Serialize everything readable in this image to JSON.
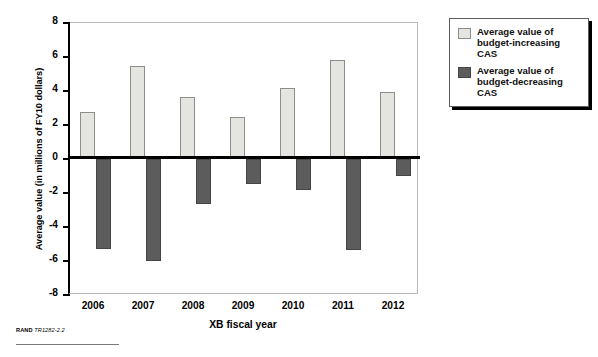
{
  "chart_data": {
    "type": "bar",
    "title": "",
    "xlabel": "XB fiscal year",
    "ylabel": "Average value (in millions of FY10 dollars)",
    "categories": [
      "2006",
      "2007",
      "2008",
      "2009",
      "2010",
      "2011",
      "2012"
    ],
    "ylim": [
      -8,
      8
    ],
    "yticks": [
      "8",
      "6",
      "4",
      "2",
      "0",
      "-2",
      "-4",
      "-6",
      "-8"
    ],
    "ytick_values": [
      8,
      6,
      4,
      2,
      0,
      -2,
      -4,
      -6,
      -8
    ],
    "grid": false,
    "legend_position": "right",
    "series": [
      {
        "name": "Average value of budget-increasing CAS",
        "color": "#e4e4e1",
        "values": [
          2.75,
          5.5,
          3.65,
          2.5,
          4.15,
          5.8,
          3.95
        ]
      },
      {
        "name": "Average value of budget-decreasing CAS",
        "color": "#5c5c5c",
        "values": [
          -5.3,
          -6.0,
          -2.65,
          -1.45,
          -1.8,
          -5.35,
          -1.0
        ]
      }
    ]
  },
  "legend": {
    "items": [
      {
        "label": "Average value of budget-increasing CAS",
        "swatch": "pos"
      },
      {
        "label": "Average value of budget-decreasing CAS",
        "swatch": "neg"
      }
    ]
  },
  "footer": {
    "credit_bold": "RAND ",
    "credit_italic": "TR1282-2.2"
  }
}
